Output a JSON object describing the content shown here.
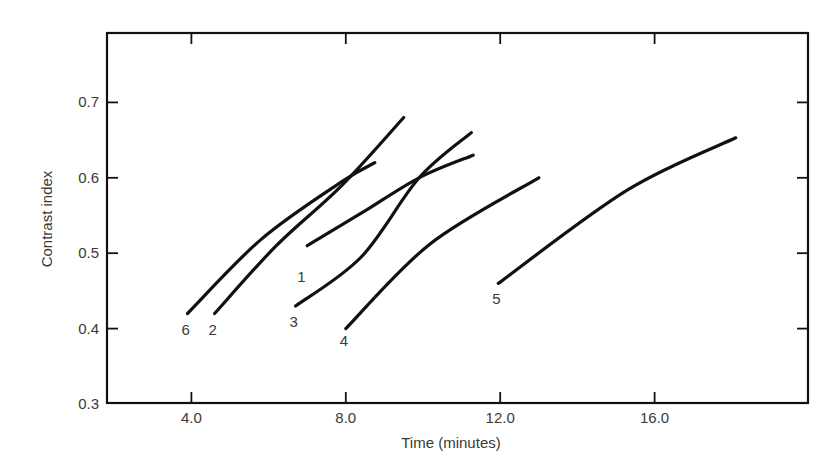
{
  "chart_data": {
    "type": "line",
    "title": "",
    "xlabel": "Time (minutes)",
    "ylabel": "Contrast index",
    "xlim": [
      1.9,
      20.0
    ],
    "ylim": [
      0.3,
      0.8
    ],
    "xticks": [
      4.0,
      8.0,
      12.0,
      16.0
    ],
    "xtick_labels": [
      "4.0",
      "8.0",
      "12.0",
      "16.0"
    ],
    "yticks": [
      0.3,
      0.4,
      0.5,
      0.6,
      0.7
    ],
    "ytick_labels": [
      "0.3",
      "0.4",
      "0.5",
      "0.6",
      "0.7"
    ],
    "grid": false,
    "legend": "none (curves labeled directly at their start points)",
    "series": [
      {
        "name": "1",
        "label_at": [
          6.85,
          0.47
        ],
        "points": [
          [
            7.0,
            0.51
          ],
          [
            8.4,
            0.553
          ],
          [
            9.9,
            0.6
          ],
          [
            11.3,
            0.63
          ]
        ]
      },
      {
        "name": "2",
        "label_at": [
          4.55,
          0.4
        ],
        "points": [
          [
            4.6,
            0.42
          ],
          [
            6.2,
            0.51
          ],
          [
            7.9,
            0.59
          ],
          [
            9.5,
            0.68
          ]
        ]
      },
      {
        "name": "3",
        "label_at": [
          6.65,
          0.41
        ],
        "points": [
          [
            6.7,
            0.43
          ],
          [
            8.4,
            0.495
          ],
          [
            9.9,
            0.6
          ],
          [
            11.25,
            0.66
          ]
        ]
      },
      {
        "name": "4",
        "label_at": [
          7.95,
          0.385
        ],
        "points": [
          [
            8.0,
            0.4
          ],
          [
            10.2,
            0.513
          ],
          [
            13.0,
            0.6
          ]
        ]
      },
      {
        "name": "5",
        "label_at": [
          11.9,
          0.44
        ],
        "points": [
          [
            11.95,
            0.46
          ],
          [
            15.3,
            0.584
          ],
          [
            18.1,
            0.653
          ]
        ]
      },
      {
        "name": "6",
        "label_at": [
          3.85,
          0.4
        ],
        "points": [
          [
            3.9,
            0.42
          ],
          [
            5.8,
            0.518
          ],
          [
            7.9,
            0.595
          ],
          [
            8.75,
            0.62
          ]
        ]
      }
    ]
  }
}
